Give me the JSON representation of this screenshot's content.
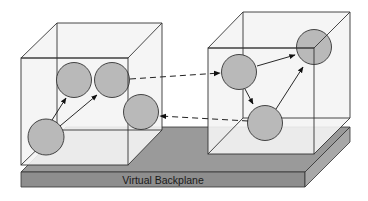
{
  "diagram": {
    "backplane": {
      "label": "Virtual Backplane",
      "top_color": "#9a9a9a",
      "front_color": "#8e8e8e",
      "side_color": "#a8a8a8"
    },
    "cubes": [
      {
        "id": "left-cube",
        "nodes": 4
      },
      {
        "id": "right-cube",
        "nodes": 3
      }
    ],
    "node_color": "#b9b9b9",
    "edge_color": "#222222",
    "connections": [
      {
        "from": "left-cube.node-2",
        "to": "right-cube.node-1",
        "style": "dashed"
      },
      {
        "from": "right-cube.node-3",
        "to": "left-cube.node-3",
        "style": "dashed"
      }
    ]
  }
}
